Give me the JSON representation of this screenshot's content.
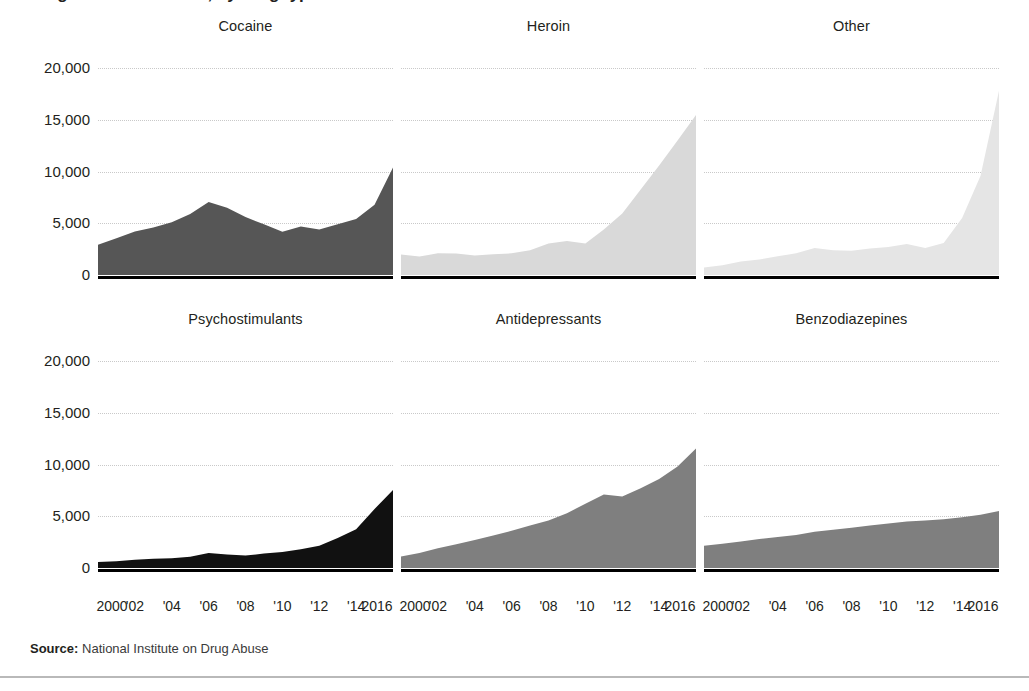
{
  "headline": {
    "text": "Drug overdose deaths, by drug type — United States"
  },
  "source": {
    "label": "Source:",
    "value": " National Institute on Drug Abuse"
  },
  "axes": {
    "y_ticks": [
      "20,000",
      "15,000",
      "10,000",
      "5,000",
      "0"
    ],
    "x_ticks": [
      "2000",
      "'02",
      "'04",
      "'06",
      "'08",
      "'10",
      "'12",
      "'14",
      "2016"
    ]
  },
  "chart_data": {
    "type": "area",
    "title": "Drug overdose deaths, by drug type",
    "xlabel": "",
    "ylabel": "",
    "ylim": [
      0,
      20000
    ],
    "xlim": [
      2000,
      2016
    ],
    "grid": true,
    "legend": "none",
    "layout": "small-multiples 2 rows x 3 columns, shared axes",
    "x": [
      2000,
      2001,
      2002,
      2003,
      2004,
      2005,
      2006,
      2007,
      2008,
      2009,
      2010,
      2011,
      2012,
      2013,
      2014,
      2015,
      2016
    ],
    "y_tick_values": [
      0,
      5000,
      10000,
      15000,
      20000
    ],
    "panels": [
      {
        "name": "Cocaine",
        "row": 0,
        "col": 0,
        "color": "#565656",
        "values": [
          2920,
          3550,
          4200,
          4600,
          5100,
          5900,
          7050,
          6500,
          5600,
          4900,
          4180,
          4680,
          4400,
          4900,
          5400,
          6780,
          10375
        ]
      },
      {
        "name": "Heroin",
        "row": 0,
        "col": 1,
        "color": "#d9d9d9",
        "values": [
          1990,
          1780,
          2090,
          2080,
          1880,
          2000,
          2090,
          2400,
          3040,
          3280,
          3040,
          4400,
          5930,
          8260,
          10570,
          12990,
          15470
        ]
      },
      {
        "name": "Other",
        "row": 0,
        "col": 2,
        "color": "#e5e5e5",
        "values": [
          730,
          950,
          1300,
          1500,
          1800,
          2100,
          2600,
          2400,
          2350,
          2550,
          2700,
          3000,
          2600,
          3100,
          5500,
          9600,
          17800
        ]
      },
      {
        "name": "Psychostimulants",
        "row": 1,
        "col": 0,
        "color": "#111111",
        "values": [
          580,
          650,
          800,
          900,
          930,
          1080,
          1450,
          1300,
          1200,
          1400,
          1550,
          1800,
          2150,
          2900,
          3750,
          5700,
          7540
        ]
      },
      {
        "name": "Antidepressants",
        "row": 1,
        "col": 1,
        "color": "#7f7f7f",
        "values": [
          1100,
          1450,
          1900,
          2300,
          2700,
          3150,
          3600,
          4100,
          4600,
          5300,
          6200,
          7100,
          6900,
          7700,
          8600,
          9800,
          11540
        ]
      },
      {
        "name": "Benzodiazepines",
        "row": 1,
        "col": 2,
        "color": "#7f7f7f",
        "values": [
          2150,
          2350,
          2550,
          2800,
          3000,
          3200,
          3500,
          3700,
          3900,
          4100,
          4300,
          4500,
          4600,
          4700,
          4900,
          5150,
          5500
        ]
      }
    ]
  }
}
